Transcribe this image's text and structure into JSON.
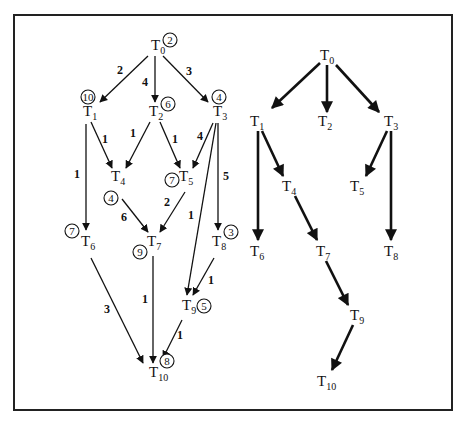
{
  "figure": {
    "frame": {
      "x": 14,
      "y": 15,
      "width": 438,
      "height": 395
    }
  },
  "left_graph": {
    "title": "Task graph with priorities and edge weights",
    "nodes": [
      {
        "id": "T0",
        "label": "T",
        "sub": "0",
        "x": 157,
        "y": 50,
        "priority": "2",
        "px": 170,
        "py": 40
      },
      {
        "id": "T1",
        "label": "T",
        "sub": "1",
        "x": 89,
        "y": 116,
        "priority": "10",
        "px": 88,
        "py": 97
      },
      {
        "id": "T2",
        "label": "T",
        "sub": "2",
        "x": 155,
        "y": 116,
        "priority": "6",
        "px": 168,
        "py": 104
      },
      {
        "id": "T3",
        "label": "T",
        "sub": "3",
        "x": 219,
        "y": 116,
        "priority": "4",
        "px": 219,
        "py": 97
      },
      {
        "id": "T4",
        "label": "T",
        "sub": "4",
        "x": 117,
        "y": 181,
        "priority": "4",
        "px": 111,
        "py": 198
      },
      {
        "id": "T5",
        "label": "T",
        "sub": "5",
        "x": 185,
        "y": 181,
        "priority": "7",
        "px": 172,
        "py": 180
      },
      {
        "id": "T6",
        "label": "T",
        "sub": "6",
        "x": 87,
        "y": 246,
        "priority": "7",
        "px": 72,
        "py": 231
      },
      {
        "id": "T7",
        "label": "T",
        "sub": "7",
        "x": 153,
        "y": 246,
        "priority": "9",
        "px": 140,
        "py": 252
      },
      {
        "id": "T8",
        "label": "T",
        "sub": "8",
        "x": 218,
        "y": 246,
        "priority": "3",
        "px": 231,
        "py": 232
      },
      {
        "id": "T9",
        "label": "T",
        "sub": "9",
        "x": 188,
        "y": 310,
        "priority": "5",
        "px": 204,
        "py": 306
      },
      {
        "id": "T10",
        "label": "T",
        "sub": "10",
        "x": 155,
        "y": 377,
        "priority": "8",
        "px": 167,
        "py": 361
      }
    ],
    "edges": [
      {
        "from": "T0",
        "to": "T1",
        "x1": 148,
        "y1": 56,
        "x2": 100,
        "y2": 102,
        "weight": "2",
        "wx": 120,
        "wy": 74
      },
      {
        "from": "T0",
        "to": "T2",
        "x1": 155,
        "y1": 56,
        "x2": 155,
        "y2": 102,
        "weight": "4",
        "wx": 145,
        "wy": 86
      },
      {
        "from": "T0",
        "to": "T3",
        "x1": 163,
        "y1": 56,
        "x2": 208,
        "y2": 102,
        "weight": "3",
        "wx": 189,
        "wy": 75
      },
      {
        "from": "T1",
        "to": "T4",
        "x1": 91,
        "y1": 122,
        "x2": 112,
        "y2": 168,
        "weight": "1",
        "wx": 105,
        "wy": 143
      },
      {
        "from": "T1",
        "to": "T6",
        "x1": 86,
        "y1": 124,
        "x2": 86,
        "y2": 230,
        "weight": "1",
        "wx": 77,
        "wy": 178
      },
      {
        "from": "T2",
        "to": "T4",
        "x1": 150,
        "y1": 122,
        "x2": 126,
        "y2": 168,
        "weight": "1",
        "wx": 133,
        "wy": 137
      },
      {
        "from": "T2",
        "to": "T5",
        "x1": 160,
        "y1": 122,
        "x2": 180,
        "y2": 168,
        "weight": "1",
        "wx": 175,
        "wy": 143
      },
      {
        "from": "T3",
        "to": "T5",
        "x1": 213,
        "y1": 123,
        "x2": 193,
        "y2": 168,
        "weight": "4",
        "wx": 200,
        "wy": 140
      },
      {
        "from": "T3",
        "to": "T8",
        "x1": 218,
        "y1": 123,
        "x2": 218,
        "y2": 230,
        "weight": "5",
        "wx": 226,
        "wy": 180
      },
      {
        "from": "T3",
        "to": "T9",
        "x1": 216,
        "y1": 123,
        "x2": 187,
        "y2": 295,
        "weight": "1",
        "wx": 191,
        "wy": 219
      },
      {
        "from": "T4",
        "to": "T7",
        "x1": 122,
        "y1": 199,
        "x2": 148,
        "y2": 232,
        "weight": "6",
        "wx": 124,
        "wy": 221
      },
      {
        "from": "T5",
        "to": "T7",
        "x1": 185,
        "y1": 192,
        "x2": 160,
        "y2": 232,
        "weight": "2",
        "wx": 167,
        "wy": 206
      },
      {
        "from": "T6",
        "to": "T10",
        "x1": 91,
        "y1": 258,
        "x2": 143,
        "y2": 363,
        "weight": "3",
        "wx": 107,
        "wy": 313
      },
      {
        "from": "T7",
        "to": "T10",
        "x1": 153,
        "y1": 256,
        "x2": 153,
        "y2": 363,
        "weight": "1",
        "wx": 145,
        "wy": 303
      },
      {
        "from": "T8",
        "to": "T9",
        "x1": 214,
        "y1": 258,
        "x2": 193,
        "y2": 295,
        "weight": "1",
        "wx": 211,
        "wy": 284
      },
      {
        "from": "T9",
        "to": "T10",
        "x1": 182,
        "y1": 320,
        "x2": 163,
        "y2": 358,
        "weight": "1",
        "wx": 180,
        "wy": 339
      }
    ]
  },
  "right_graph": {
    "title": "Spanning tree",
    "nodes": [
      {
        "id": "T0",
        "label": "T",
        "sub": "0",
        "x": 326,
        "y": 60
      },
      {
        "id": "T1",
        "label": "T",
        "sub": "1",
        "x": 256,
        "y": 126
      },
      {
        "id": "T2",
        "label": "T",
        "sub": "2",
        "x": 324,
        "y": 126
      },
      {
        "id": "T3",
        "label": "T",
        "sub": "3",
        "x": 390,
        "y": 126
      },
      {
        "id": "T4",
        "label": "T",
        "sub": "4",
        "x": 288,
        "y": 191
      },
      {
        "id": "T5",
        "label": "T",
        "sub": "5",
        "x": 356,
        "y": 191
      },
      {
        "id": "T6",
        "label": "T",
        "sub": "6",
        "x": 256,
        "y": 256
      },
      {
        "id": "T7",
        "label": "T",
        "sub": "7",
        "x": 322,
        "y": 256
      },
      {
        "id": "T8",
        "label": "T",
        "sub": "8",
        "x": 390,
        "y": 256
      },
      {
        "id": "T9",
        "label": "T",
        "sub": "9",
        "x": 356,
        "y": 320
      },
      {
        "id": "T10",
        "label": "T",
        "sub": "10",
        "x": 323,
        "y": 386
      }
    ],
    "edges": [
      {
        "from": "T0",
        "to": "T1",
        "x1": 320,
        "y1": 63,
        "x2": 272,
        "y2": 108
      },
      {
        "from": "T0",
        "to": "T2",
        "x1": 327,
        "y1": 65,
        "x2": 327,
        "y2": 112
      },
      {
        "from": "T0",
        "to": "T3",
        "x1": 336,
        "y1": 65,
        "x2": 379,
        "y2": 112
      },
      {
        "from": "T1",
        "to": "T4",
        "x1": 262,
        "y1": 131,
        "x2": 283,
        "y2": 176
      },
      {
        "from": "T1",
        "to": "T6",
        "x1": 258,
        "y1": 131,
        "x2": 258,
        "y2": 240
      },
      {
        "from": "T3",
        "to": "T5",
        "x1": 387,
        "y1": 131,
        "x2": 366,
        "y2": 176
      },
      {
        "from": "T3",
        "to": "T8",
        "x1": 391,
        "y1": 131,
        "x2": 391,
        "y2": 240
      },
      {
        "from": "T4",
        "to": "T7",
        "x1": 295,
        "y1": 196,
        "x2": 317,
        "y2": 240
      },
      {
        "from": "T7",
        "to": "T9",
        "x1": 326,
        "y1": 261,
        "x2": 348,
        "y2": 305
      },
      {
        "from": "T9",
        "to": "T10",
        "x1": 353,
        "y1": 325,
        "x2": 332,
        "y2": 370
      }
    ]
  },
  "colors": {
    "ink": "#111111",
    "background": "#ffffff",
    "frame": "#222222"
  }
}
